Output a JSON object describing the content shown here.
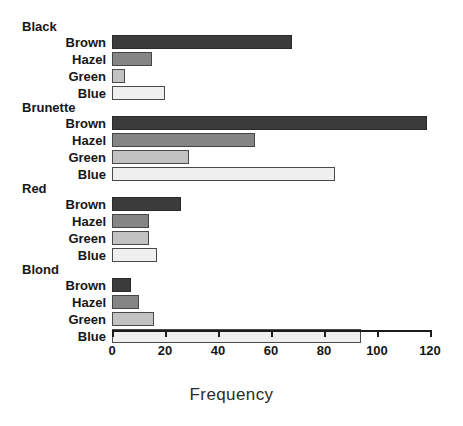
{
  "chart_data": {
    "type": "bar",
    "orientation": "horizontal",
    "title": "",
    "xlabel": "Frequency",
    "ylabel": "",
    "xlim": [
      0,
      120
    ],
    "xticks": [
      0,
      20,
      40,
      60,
      80,
      100,
      120
    ],
    "xtick_labels": [
      "0",
      "20",
      "40",
      "60",
      "80",
      "100",
      "120"
    ],
    "grid": false,
    "legend": "none",
    "groups": [
      {
        "label": "Black",
        "categories": [
          "Brown",
          "Hazel",
          "Green",
          "Blue"
        ],
        "values": [
          68,
          15,
          5,
          20
        ]
      },
      {
        "label": "Brunette",
        "categories": [
          "Brown",
          "Hazel",
          "Green",
          "Blue"
        ],
        "values": [
          119,
          54,
          29,
          84
        ]
      },
      {
        "label": "Red",
        "categories": [
          "Brown",
          "Hazel",
          "Green",
          "Blue"
        ],
        "values": [
          26,
          14,
          14,
          17
        ]
      },
      {
        "label": "Blond",
        "categories": [
          "Brown",
          "Hazel",
          "Green",
          "Blue"
        ],
        "values": [
          7,
          10,
          16,
          94
        ]
      }
    ],
    "bar_colors": {
      "Brown": "#3b3b3b",
      "Hazel": "#858585",
      "Green": "#c2c2c2",
      "Blue": "#efefef"
    },
    "bar_border_color": "#4a4a4a",
    "axis_color": "#1c1c1c",
    "background": "#ffffff"
  }
}
